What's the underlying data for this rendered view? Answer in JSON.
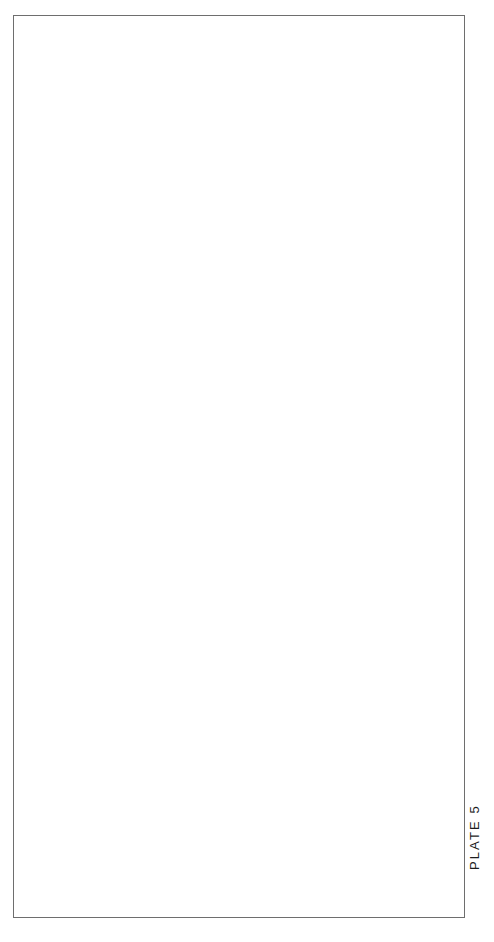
{
  "plate": {
    "caption": "PLATE 5",
    "background_color": "#ffffff",
    "frame_color": "#6e6e6e",
    "artist_monogram": "ℳ"
  },
  "illustration": {
    "subject": "salmon",
    "orientation": "rotated-90-head-down",
    "medium": "halftone engraving",
    "alt_text": "Lateral view halftone illustration of an adult male salmon with hooked kype jaw, spotted back and caudal fin, shown rotated so the head points toward the bottom of the plate.",
    "palette": {
      "back_dark": "#4a4a4a",
      "body_mid": "#8d8d8d",
      "belly_light": "#c9c9c9",
      "highlight": "#e6e6e6",
      "fin_dark": "#3c3c3c",
      "spot": "#1f1f1f",
      "outline": "#2e2e2e",
      "eye_ring": "#f2f2f2",
      "eye_pupil": "#161616"
    },
    "parts": [
      {
        "name": "caudal-fin",
        "label": "Caudal fin (tail)"
      },
      {
        "name": "caudal-peduncle",
        "label": "Caudal peduncle"
      },
      {
        "name": "adipose-fin",
        "label": "Adipose fin"
      },
      {
        "name": "dorsal-fin",
        "label": "Dorsal fin"
      },
      {
        "name": "anal-fin",
        "label": "Anal fin"
      },
      {
        "name": "pelvic-fin",
        "label": "Pelvic fin"
      },
      {
        "name": "pectoral-fin",
        "label": "Pectoral fin"
      },
      {
        "name": "head",
        "label": "Head"
      },
      {
        "name": "kype-jaw",
        "label": "Hooked upper jaw (kype)"
      },
      {
        "name": "lower-jaw",
        "label": "Lower jaw"
      },
      {
        "name": "eye",
        "label": "Eye"
      },
      {
        "name": "gill-cover",
        "label": "Operculum"
      }
    ]
  }
}
